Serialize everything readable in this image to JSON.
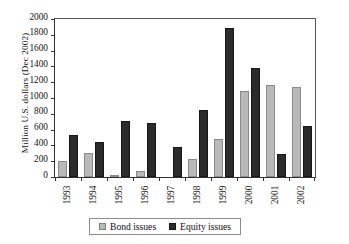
{
  "chart_data": {
    "type": "bar",
    "title": "",
    "xlabel": "",
    "ylabel": "Million U.S. dollars (Dec 2002)",
    "ylim": [
      0,
      2000
    ],
    "ytick_step": 200,
    "yticks": [
      2000,
      1800,
      1600,
      1400,
      1200,
      1000,
      800,
      600,
      400,
      200,
      0
    ],
    "ytick_labels": [
      "2000",
      "1800",
      "1600",
      "1400",
      "1200",
      "1000",
      "800",
      "600",
      "400",
      "200",
      "0"
    ],
    "grid": false,
    "legend_position": "bottom",
    "categories": [
      "1993",
      "1994",
      "1995",
      "1996",
      "1997",
      "1998",
      "1999",
      "2000",
      "2001",
      "2002"
    ],
    "series": [
      {
        "name": "Bond issues",
        "color": "#b9b9b9",
        "values": [
          200,
          300,
          30,
          70,
          0,
          225,
          475,
          1095,
          1165,
          1135
        ]
      },
      {
        "name": "Equity issues",
        "color": "#2b2b2b",
        "values": [
          535,
          445,
          710,
          680,
          380,
          845,
          1890,
          1385,
          295,
          645
        ]
      }
    ]
  },
  "legend": {
    "items": [
      {
        "label": "Bond issues",
        "swatch": "bond-swatch-icon"
      },
      {
        "label": "Equity issues",
        "swatch": "equity-swatch-icon"
      }
    ]
  }
}
